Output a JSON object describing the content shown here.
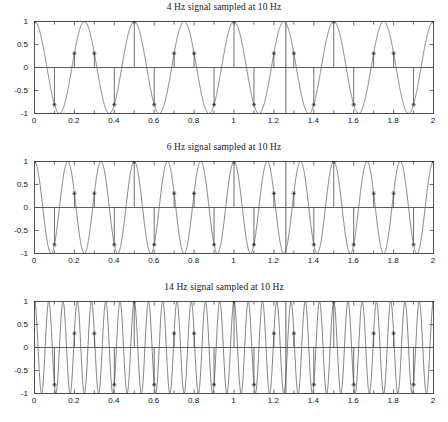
{
  "figure": {
    "width": 448,
    "height": 422,
    "background": "#ffffff",
    "axis_color": "#4d4d4d",
    "curve_color": "#555555",
    "stem_color": "#555555",
    "marker_color": "#333333",
    "caption_fragment": ""
  },
  "chart_data": [
    {
      "type": "line",
      "title": "4 Hz signal sampled at 10 Hz",
      "xlabel": "",
      "ylabel": "",
      "xlim": [
        0,
        2
      ],
      "ylim": [
        -1,
        1
      ],
      "grid": false,
      "legend": null,
      "xticks": [
        0,
        0.2,
        0.4,
        0.6,
        0.8,
        1,
        1.2,
        1.4,
        1.6,
        1.8,
        2
      ],
      "xticklabels": [
        "0",
        "0.2",
        "0.4",
        "0.6",
        "0.8",
        "1",
        "1.2",
        "1.4",
        "1.6",
        "1.8",
        "2"
      ],
      "yticks": [
        -1,
        -0.5,
        0,
        0.5,
        1
      ],
      "yticklabels": [
        "-1",
        "-0.5",
        "0",
        "0.5",
        "1"
      ],
      "series": [
        {
          "name": "continuous 4 Hz cosine",
          "kind": "continuous",
          "frequency_hz": 4,
          "amplitude": 1,
          "phase": 0,
          "expression": "cos(2*pi*4*t)"
        },
        {
          "name": "samples at 10 Hz",
          "kind": "stem",
          "sample_rate_hz": 10,
          "sample_interval": 0.1,
          "marker": "star",
          "x": [
            0,
            0.1,
            0.2,
            0.3,
            0.4,
            0.5,
            0.6,
            0.7,
            0.8,
            0.9,
            1,
            1.1,
            1.2,
            1.3,
            1.4,
            1.5,
            1.6,
            1.7,
            1.8,
            1.9,
            2
          ],
          "y": [
            1,
            -0.809,
            0.309,
            0.309,
            -0.809,
            1,
            -0.809,
            0.309,
            0.309,
            -0.809,
            1,
            -0.809,
            0.309,
            0.309,
            -0.809,
            1,
            -0.809,
            0.309,
            0.309,
            -0.809,
            1
          ]
        }
      ],
      "annotations": [
        {
          "kind": "vertical-marker-line",
          "x": 1.26
        }
      ]
    },
    {
      "type": "line",
      "title": "6 Hz signal sampled at 10 Hz",
      "xlabel": "",
      "ylabel": "",
      "xlim": [
        0,
        2
      ],
      "ylim": [
        -1,
        1
      ],
      "grid": false,
      "legend": null,
      "xticks": [
        0,
        0.2,
        0.4,
        0.6,
        0.8,
        1,
        1.2,
        1.4,
        1.6,
        1.8,
        2
      ],
      "xticklabels": [
        "0",
        "0.2",
        "0.4",
        "0.6",
        "0.8",
        "1",
        "1.2",
        "1.4",
        "1.6",
        "1.8",
        "2"
      ],
      "yticks": [
        -1,
        -0.5,
        0,
        0.5,
        1
      ],
      "yticklabels": [
        "-1",
        "-0.5",
        "0",
        "0.5",
        "1"
      ],
      "series": [
        {
          "name": "continuous 6 Hz cosine",
          "kind": "continuous",
          "frequency_hz": 6,
          "amplitude": 1,
          "phase": 0,
          "expression": "cos(2*pi*6*t)"
        },
        {
          "name": "samples at 10 Hz",
          "kind": "stem",
          "sample_rate_hz": 10,
          "sample_interval": 0.1,
          "marker": "star",
          "x": [
            0,
            0.1,
            0.2,
            0.3,
            0.4,
            0.5,
            0.6,
            0.7,
            0.8,
            0.9,
            1,
            1.1,
            1.2,
            1.3,
            1.4,
            1.5,
            1.6,
            1.7,
            1.8,
            1.9,
            2
          ],
          "y": [
            1,
            -0.809,
            0.309,
            0.309,
            -0.809,
            1,
            -0.809,
            0.309,
            0.309,
            -0.809,
            1,
            -0.809,
            0.309,
            0.309,
            -0.809,
            1,
            -0.809,
            0.309,
            0.309,
            -0.809,
            1
          ]
        }
      ],
      "annotations": [
        {
          "kind": "vertical-marker-line",
          "x": 1.26
        }
      ]
    },
    {
      "type": "line",
      "title": "14 Hz signal sampled at 10 Hz",
      "xlabel": "",
      "ylabel": "",
      "xlim": [
        0,
        2
      ],
      "ylim": [
        -1,
        1
      ],
      "grid": false,
      "legend": null,
      "xticks": [
        0,
        0.2,
        0.4,
        0.6,
        0.8,
        1,
        1.2,
        1.4,
        1.6,
        1.8,
        2
      ],
      "xticklabels": [
        "0",
        "0.2",
        "0.4",
        "0.6",
        "0.8",
        "1",
        "1.2",
        "1.4",
        "1.6",
        "1.8",
        "2"
      ],
      "yticks": [
        -1,
        -0.5,
        0,
        0.5,
        1
      ],
      "yticklabels": [
        "-1",
        "-0.5",
        "0",
        "0.5",
        "1"
      ],
      "series": [
        {
          "name": "continuous 14 Hz cosine",
          "kind": "continuous",
          "frequency_hz": 14,
          "amplitude": 1,
          "phase": 0,
          "expression": "cos(2*pi*14*t)"
        },
        {
          "name": "samples at 10 Hz",
          "kind": "stem",
          "sample_rate_hz": 10,
          "sample_interval": 0.1,
          "marker": "star",
          "x": [
            0,
            0.1,
            0.2,
            0.3,
            0.4,
            0.5,
            0.6,
            0.7,
            0.8,
            0.9,
            1,
            1.1,
            1.2,
            1.3,
            1.4,
            1.5,
            1.6,
            1.7,
            1.8,
            1.9,
            2
          ],
          "y": [
            1,
            -0.809,
            0.309,
            0.309,
            -0.809,
            1,
            -0.809,
            0.309,
            0.309,
            -0.809,
            1,
            -0.809,
            0.309,
            0.309,
            -0.809,
            1,
            -0.809,
            0.309,
            0.309,
            -0.809,
            1
          ]
        }
      ],
      "annotations": [
        {
          "kind": "vertical-marker-line",
          "x": 1.26
        }
      ]
    }
  ],
  "panels": [
    {
      "top": 2,
      "plot_top": 21,
      "plot_height": 92
    },
    {
      "top": 142,
      "plot_top": 161,
      "plot_height": 92
    },
    {
      "top": 282,
      "plot_top": 301,
      "plot_height": 92
    }
  ],
  "geometry": {
    "plot_left": 34,
    "plot_width": 399
  }
}
